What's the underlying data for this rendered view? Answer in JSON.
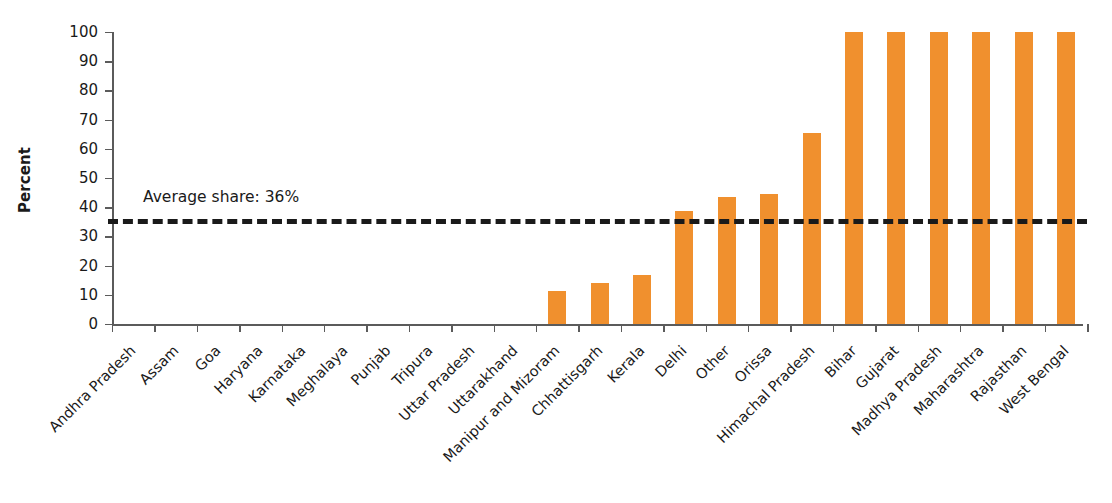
{
  "chart_data": {
    "type": "bar",
    "title": "",
    "subtitle": "",
    "xlabel": "",
    "ylabel": "Percent",
    "ylim": [
      0,
      100
    ],
    "ytick_step": 10,
    "yticks": [
      "0",
      "10",
      "20",
      "30",
      "40",
      "50",
      "60",
      "70",
      "80",
      "90",
      "100"
    ],
    "grid": false,
    "legend": null,
    "bar_color": "#F0902E",
    "axis_color": "#5B5B5B",
    "text_color": "#1A1A1A",
    "categories": [
      "Andhra Pradesh",
      "Assam",
      "Goa",
      "Haryana",
      "Karnataka",
      "Meghalaya",
      "Punjab",
      "Tripura",
      "Uttar Pradesh",
      "Uttarakhand",
      "Manipur and Mizoram",
      "Chhattisgarh",
      "Kerala",
      "Delhi",
      "Other",
      "Orissa",
      "Himachal Pradesh",
      "Bihar",
      "Gujarat",
      "Madhya Pradesh",
      "Maharashtra",
      "Rajasthan",
      "West Bengal"
    ],
    "values": [
      0,
      0,
      0,
      0,
      0,
      0,
      0,
      0,
      0,
      0,
      11.3,
      14,
      16.8,
      38.8,
      43.5,
      44.5,
      65.4,
      100,
      100,
      100,
      100,
      100,
      100
    ],
    "annotations": [
      {
        "name": "average-share-line",
        "label": "Average share: 36%",
        "value": 36,
        "style": "dashed",
        "color": "#1A1A1A"
      }
    ]
  }
}
